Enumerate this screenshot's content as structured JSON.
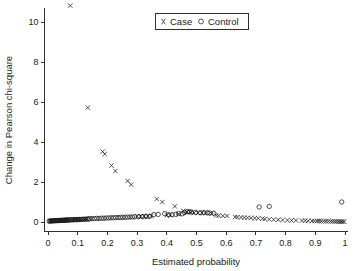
{
  "chart_data": {
    "type": "scatter",
    "title": "",
    "xlabel": "Estimated probability",
    "ylabel": "Change in Pearson chi-square",
    "xlim": [
      0,
      1
    ],
    "ylim": [
      0,
      11.2
    ],
    "grid": false,
    "legend_position": "top-center",
    "xticks": [
      0,
      0.1,
      0.2,
      0.3,
      0.4,
      0.5,
      0.6,
      0.7,
      0.8,
      0.9,
      1
    ],
    "xticklabels": [
      "0",
      "0.1",
      "0.2",
      "0.3",
      "0.4",
      "0.5",
      "0.6",
      "0.7",
      "0.8",
      "0.9",
      "1"
    ],
    "yticks": [
      0,
      2,
      4,
      6,
      8,
      10
    ],
    "yticklabels": [
      "0",
      "2",
      "4",
      "6",
      "8",
      "10"
    ],
    "series": [
      {
        "name": "Case",
        "marker": "x",
        "color": "#1a1a1a",
        "points": [
          [
            0.075,
            10.82
          ],
          [
            0.134,
            5.72
          ],
          [
            0.184,
            3.52
          ],
          [
            0.191,
            3.4
          ],
          [
            0.214,
            2.82
          ],
          [
            0.227,
            2.55
          ],
          [
            0.268,
            2.05
          ],
          [
            0.28,
            1.87
          ],
          [
            0.366,
            1.15
          ],
          [
            0.385,
            1.0
          ],
          [
            0.427,
            0.78
          ],
          [
            0.455,
            0.56
          ],
          [
            0.468,
            0.5
          ],
          [
            0.48,
            0.49
          ],
          [
            0.551,
            0.42
          ],
          [
            0.566,
            0.33
          ],
          [
            0.575,
            0.32
          ],
          [
            0.602,
            0.3
          ],
          [
            0.63,
            0.25
          ],
          [
            0.638,
            0.24
          ],
          [
            0.661,
            0.22
          ],
          [
            0.672,
            0.21
          ],
          [
            0.722,
            0.17
          ],
          [
            0.73,
            0.15
          ],
          [
            0.806,
            0.09
          ],
          [
            0.855,
            0.07
          ],
          [
            0.866,
            0.07
          ],
          [
            0.889,
            0.05
          ],
          [
            0.897,
            0.05
          ],
          [
            0.906,
            0.05
          ],
          [
            0.928,
            0.04
          ],
          [
            0.936,
            0.04
          ],
          [
            0.944,
            0.04
          ],
          [
            0.952,
            0.03
          ],
          [
            0.959,
            0.03
          ],
          [
            0.966,
            0.03
          ],
          [
            0.972,
            0.03
          ],
          [
            0.978,
            0.02
          ],
          [
            0.983,
            0.02
          ],
          [
            0.988,
            0.02
          ],
          [
            0.993,
            0.02
          ],
          [
            0.997,
            0.02
          ],
          [
            0.006,
            0.05
          ],
          [
            0.01,
            0.05
          ],
          [
            0.014,
            0.06
          ],
          [
            0.018,
            0.06
          ],
          [
            0.022,
            0.06
          ],
          [
            0.026,
            0.07
          ],
          [
            0.03,
            0.07
          ],
          [
            0.034,
            0.07
          ],
          [
            0.038,
            0.08
          ],
          [
            0.042,
            0.08
          ],
          [
            0.046,
            0.08
          ],
          [
            0.05,
            0.09
          ],
          [
            0.054,
            0.09
          ],
          [
            0.058,
            0.09
          ],
          [
            0.062,
            0.1
          ],
          [
            0.066,
            0.1
          ],
          [
            0.07,
            0.1
          ],
          [
            0.08,
            0.11
          ],
          [
            0.085,
            0.11
          ],
          [
            0.09,
            0.12
          ],
          [
            0.095,
            0.12
          ],
          [
            0.1,
            0.12
          ],
          [
            0.105,
            0.13
          ],
          [
            0.11,
            0.13
          ],
          [
            0.116,
            0.14
          ],
          [
            0.122,
            0.14
          ],
          [
            0.128,
            0.15
          ],
          [
            0.3,
            0.28
          ],
          [
            0.312,
            0.28
          ],
          [
            0.324,
            0.29
          ],
          [
            0.336,
            0.29
          ],
          [
            0.348,
            0.3
          ],
          [
            0.4,
            0.34
          ],
          [
            0.412,
            0.35
          ],
          [
            0.44,
            0.4
          ],
          [
            0.492,
            0.45
          ],
          [
            0.505,
            0.46
          ],
          [
            0.518,
            0.46
          ],
          [
            0.53,
            0.45
          ],
          [
            0.589,
            0.31
          ],
          [
            0.65,
            0.23
          ],
          [
            0.684,
            0.2
          ],
          [
            0.696,
            0.19
          ],
          [
            0.708,
            0.18
          ],
          [
            0.745,
            0.13
          ],
          [
            0.76,
            0.12
          ],
          [
            0.775,
            0.11
          ],
          [
            0.79,
            0.1
          ],
          [
            0.82,
            0.08
          ],
          [
            0.835,
            0.08
          ],
          [
            0.876,
            0.06
          ],
          [
            0.913,
            0.05
          ],
          [
            0.92,
            0.04
          ]
        ]
      },
      {
        "name": "Control",
        "marker": "o",
        "color": "#1a1a1a",
        "points": [
          [
            0.989,
            1.0
          ],
          [
            0.711,
            0.75
          ],
          [
            0.745,
            0.78
          ],
          [
            0.393,
            0.42
          ],
          [
            0.44,
            0.42
          ],
          [
            0.469,
            0.52
          ],
          [
            0.483,
            0.5
          ],
          [
            0.497,
            0.48
          ],
          [
            0.513,
            0.46
          ],
          [
            0.545,
            0.45
          ],
          [
            0.558,
            0.44
          ],
          [
            0.371,
            0.38
          ],
          [
            0.356,
            0.37
          ],
          [
            0.14,
            0.16
          ],
          [
            0.148,
            0.17
          ],
          [
            0.156,
            0.17
          ],
          [
            0.164,
            0.18
          ],
          [
            0.172,
            0.18
          ],
          [
            0.18,
            0.19
          ],
          [
            0.188,
            0.19
          ],
          [
            0.196,
            0.2
          ],
          [
            0.204,
            0.2
          ],
          [
            0.212,
            0.21
          ],
          [
            0.22,
            0.21
          ],
          [
            0.228,
            0.22
          ],
          [
            0.236,
            0.22
          ],
          [
            0.244,
            0.23
          ],
          [
            0.252,
            0.23
          ],
          [
            0.26,
            0.24
          ],
          [
            0.268,
            0.24
          ],
          [
            0.276,
            0.25
          ],
          [
            0.284,
            0.25
          ],
          [
            0.292,
            0.26
          ],
          [
            0.305,
            0.27
          ],
          [
            0.318,
            0.27
          ],
          [
            0.33,
            0.28
          ],
          [
            0.342,
            0.28
          ],
          [
            0.406,
            0.36
          ],
          [
            0.418,
            0.37
          ],
          [
            0.43,
            0.38
          ],
          [
            0.452,
            0.41
          ],
          [
            0.46,
            0.47
          ],
          [
            0.476,
            0.51
          ],
          [
            0.525,
            0.47
          ],
          [
            0.537,
            0.46
          ],
          [
            0.004,
            0.04
          ],
          [
            0.008,
            0.05
          ],
          [
            0.012,
            0.05
          ],
          [
            0.016,
            0.06
          ],
          [
            0.02,
            0.06
          ],
          [
            0.024,
            0.06
          ],
          [
            0.028,
            0.07
          ],
          [
            0.032,
            0.07
          ],
          [
            0.036,
            0.07
          ],
          [
            0.04,
            0.08
          ],
          [
            0.044,
            0.08
          ],
          [
            0.048,
            0.08
          ],
          [
            0.052,
            0.09
          ],
          [
            0.056,
            0.09
          ],
          [
            0.06,
            0.09
          ],
          [
            0.064,
            0.1
          ],
          [
            0.068,
            0.1
          ],
          [
            0.072,
            0.1
          ],
          [
            0.077,
            0.11
          ],
          [
            0.082,
            0.11
          ],
          [
            0.087,
            0.11
          ],
          [
            0.092,
            0.12
          ],
          [
            0.097,
            0.12
          ],
          [
            0.102,
            0.12
          ],
          [
            0.107,
            0.13
          ],
          [
            0.113,
            0.13
          ],
          [
            0.119,
            0.14
          ],
          [
            0.125,
            0.14
          ],
          [
            0.131,
            0.15
          ],
          [
            0.136,
            0.15
          ]
        ]
      }
    ]
  },
  "legend": {
    "case_label": "Case",
    "control_label": "Control",
    "case_marker": "x-marker-icon",
    "control_marker": "o-marker-icon"
  },
  "axes": {
    "x_title": "Estimated probability",
    "y_title": "Change in Pearson chi-square"
  }
}
